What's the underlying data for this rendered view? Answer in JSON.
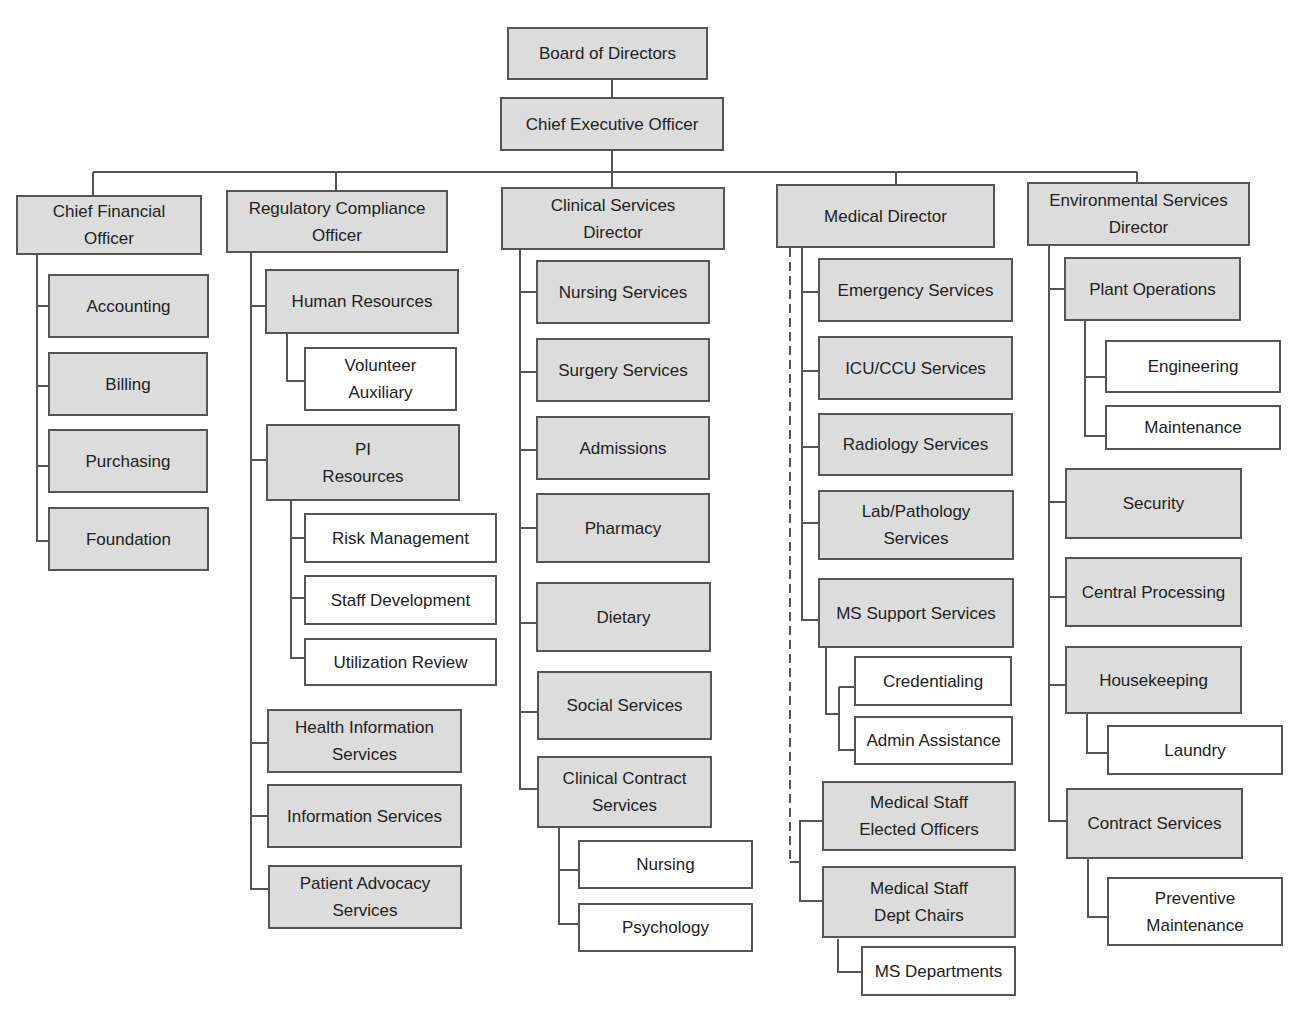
{
  "chart": {
    "board": "Board of Directors",
    "ceo": "Chief Executive Officer",
    "cfo": {
      "title": "Chief Financial\nOfficer",
      "children": [
        "Accounting",
        "Billing",
        "Purchasing",
        "Foundation"
      ]
    },
    "rco": {
      "title": "Regulatory Compliance\nOfficer",
      "hr": "Human Resources",
      "volunteer": "Volunteer\nAuxiliary",
      "pi": "PI\nResources",
      "risk": "Risk Management",
      "staffdev": "Staff Development",
      "util": "Utilization Review",
      "his": "Health Information\nServices",
      "infosvc": "Information Services",
      "advocacy": "Patient Advocacy\nServices"
    },
    "csd": {
      "title": "Clinical Services\nDirector",
      "children": [
        "Nursing Services",
        "Surgery Services",
        "Admissions",
        "Pharmacy",
        "Dietary",
        "Social Services",
        "Clinical Contract\nServices"
      ],
      "contract_children": [
        "Nursing",
        "Psychology"
      ]
    },
    "md": {
      "title": "Medical Director",
      "children": [
        "Emergency Services",
        "ICU/CCU Services",
        "Radiology Services",
        "Lab/Pathology\nServices",
        "MS Support Services"
      ],
      "ms_children": [
        "Credentialing",
        "Admin Assistance"
      ],
      "elected": "Medical Staff\nElected Officers",
      "chairs": "Medical Staff\nDept Chairs",
      "msdept": "MS Departments"
    },
    "esd": {
      "title": "Environmental Services\nDirector",
      "plant": "Plant Operations",
      "engineering": "Engineering",
      "maintenance": "Maintenance",
      "security": "Security",
      "central": "Central Processing",
      "housekeeping": "Housekeeping",
      "laundry": "Laundry",
      "contract": "Contract Services",
      "preventive": "Preventive\nMaintenance"
    }
  }
}
